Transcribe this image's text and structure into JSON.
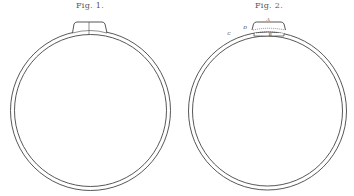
{
  "figures": [
    {
      "title": "Fig. 1.",
      "title_x": 90,
      "ring": {
        "cx": 90.5,
        "cy": 110.5,
        "r_outer": 80,
        "r_inner": 76
      },
      "clasp": {
        "x1": 74,
        "x2": 105,
        "top": 22,
        "divider_x": 89,
        "style": "solid"
      },
      "labels": []
    },
    {
      "title": "Fig. 2.",
      "title_x": 269,
      "ring": {
        "cx": 267.5,
        "cy": 111,
        "r_outer": 79,
        "r_inner": 75
      },
      "clasp": {
        "x1": 253,
        "x2": 284,
        "top": 22,
        "style": "dotted"
      },
      "labels": [
        {
          "text": "A",
          "x": 268,
          "y": 19
        },
        {
          "text": "B",
          "x": 270,
          "y": 34
        },
        {
          "text": "C",
          "x": 229,
          "y": 33
        },
        {
          "text": "D",
          "x": 245,
          "y": 27
        }
      ]
    }
  ],
  "colors": {
    "line": "#444444",
    "background": "#ffffff"
  }
}
